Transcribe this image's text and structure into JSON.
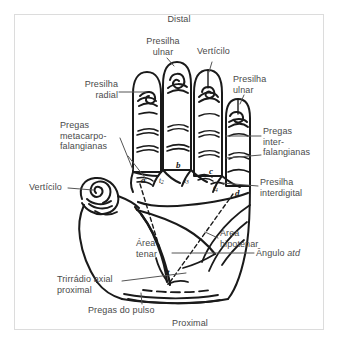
{
  "figure": {
    "title_distal": "Distal",
    "title_proximal": "Proximal",
    "frame_color": "#dcdcdc",
    "ink_color": "#1a1a1a",
    "label_color": "#4a4a4a",
    "background": "#ffffff"
  },
  "labels": {
    "distal": "Distal",
    "proximal": "Proximal",
    "presilha_ulnar_top": "Presilha\nulnar",
    "verticilo_top": "Vertícilo",
    "presilha_radial": "Presilha\nradial",
    "presilha_ulnar_right": "Presilha\nulnar",
    "pregas_metacarpo_falangianas": "Pregas\nmetacarpo-\nfalangianas",
    "pregas_inter_falangianas": "Pregas\ninter-\nfalangianas",
    "presilha_interdigital": "Presilha\ninterdigital",
    "verticilo_left": "Vertícilo",
    "area_tenar": "Área\ntenar",
    "area_hipotenar": "Área\nhipotenar",
    "angulo_atd": "Ângulo atd",
    "angulo_atd_plain": "Ângulo ",
    "angulo_atd_italic": "atd",
    "trirradio_axial_proximal": "Trirrádio axial\nproximal",
    "pregas_do_pulso": "Pregas do pulso"
  },
  "markers": {
    "a": "a",
    "b": "b",
    "c": "c",
    "d": "d",
    "t": "t",
    "t1": "t",
    "t1_sub": "1",
    "t2": "t",
    "t2_sub": "2",
    "t3": "t",
    "t3_sub": "3",
    "t4": "t",
    "t4_sub": "4"
  }
}
